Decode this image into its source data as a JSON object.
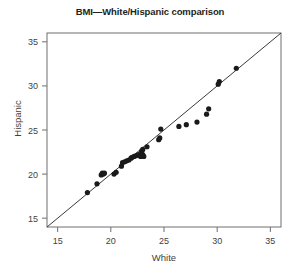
{
  "chart_data": {
    "type": "scatter",
    "title": "BMI—White/Hispanic comparison",
    "xlabel": "White",
    "ylabel": "Hispanic",
    "xlim": [
      14,
      36
    ],
    "ylim": [
      14,
      36
    ],
    "xticks": [
      15,
      20,
      25,
      30,
      35
    ],
    "yticks": [
      15,
      20,
      25,
      30,
      35
    ],
    "xtick_labels": [
      "15",
      "20",
      "25",
      "30",
      "35"
    ],
    "ytick_labels": [
      "15",
      "20",
      "25",
      "30",
      "35"
    ],
    "grid": false,
    "legend": false,
    "marker": "filled-circle",
    "marker_color": "#1a1a1a",
    "reference_line": {
      "name": "identity-line",
      "description": "y = x diagonal reference line",
      "from": [
        14,
        14
      ],
      "to": [
        36,
        36
      ],
      "color": "#3a3a3a"
    },
    "series": [
      {
        "name": "BMI pairs",
        "points": [
          [
            17.8,
            17.9
          ],
          [
            18.7,
            18.9
          ],
          [
            19.1,
            19.9
          ],
          [
            19.2,
            20.1
          ],
          [
            19.3,
            20.0
          ],
          [
            19.4,
            20.1
          ],
          [
            20.3,
            20.0
          ],
          [
            20.5,
            20.2
          ],
          [
            21.0,
            20.9
          ],
          [
            21.1,
            21.3
          ],
          [
            21.3,
            21.4
          ],
          [
            21.5,
            21.5
          ],
          [
            21.7,
            21.6
          ],
          [
            21.9,
            21.8
          ],
          [
            22.0,
            21.9
          ],
          [
            22.2,
            22.0
          ],
          [
            22.4,
            22.1
          ],
          [
            22.6,
            22.2
          ],
          [
            22.8,
            22.0
          ],
          [
            22.9,
            22.1
          ],
          [
            22.9,
            22.6
          ],
          [
            23.0,
            22.8
          ],
          [
            23.0,
            22.2
          ],
          [
            23.1,
            22.0
          ],
          [
            23.4,
            23.1
          ],
          [
            24.5,
            23.9
          ],
          [
            24.6,
            24.1
          ],
          [
            24.7,
            25.1
          ],
          [
            26.4,
            25.4
          ],
          [
            27.1,
            25.6
          ],
          [
            28.1,
            25.9
          ],
          [
            29.0,
            26.8
          ],
          [
            29.2,
            27.4
          ],
          [
            30.1,
            30.2
          ],
          [
            30.2,
            30.5
          ],
          [
            31.8,
            32.0
          ]
        ]
      }
    ]
  }
}
